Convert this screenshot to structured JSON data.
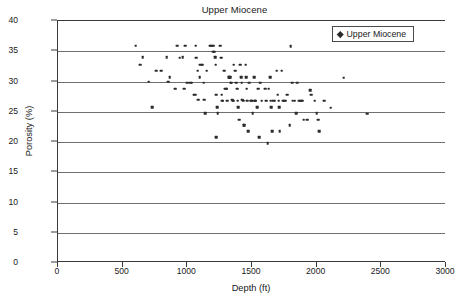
{
  "chart_data": {
    "type": "scatter",
    "title": "Upper Miocene",
    "xlabel": "Depth (ft)",
    "ylabel": "Porosity (%)",
    "xlim": [
      0,
      3000
    ],
    "ylim": [
      0,
      40
    ],
    "xticks": [
      0,
      500,
      1000,
      1500,
      2000,
      2500,
      3000
    ],
    "yticks": [
      0,
      5,
      10,
      15,
      20,
      25,
      30,
      35,
      40
    ],
    "grid": "horizontal",
    "legend_position": "top-right",
    "marker_color": "#2b2b2b",
    "marker_shape": "diamond",
    "series": [
      {
        "name": "Upper Miocene",
        "points": [
          [
            600,
            35.9
          ],
          [
            655,
            34.0
          ],
          [
            635,
            32.8
          ],
          [
            700,
            30.0
          ],
          [
            730,
            25.8
          ],
          [
            760,
            31.8
          ],
          [
            800,
            31.8
          ],
          [
            840,
            34.0
          ],
          [
            850,
            30.0
          ],
          [
            865,
            30.7
          ],
          [
            920,
            35.9
          ],
          [
            905,
            28.8
          ],
          [
            940,
            33.9
          ],
          [
            965,
            34.0
          ],
          [
            975,
            28.8
          ],
          [
            985,
            35.9
          ],
          [
            1000,
            29.8
          ],
          [
            1020,
            29.8
          ],
          [
            1035,
            29.8
          ],
          [
            1050,
            27.8
          ],
          [
            1060,
            27.8
          ],
          [
            1065,
            35.9
          ],
          [
            1070,
            33.9
          ],
          [
            1080,
            31.8
          ],
          [
            1085,
            27.0
          ],
          [
            1095,
            30.7
          ],
          [
            1100,
            32.8
          ],
          [
            1110,
            32.8
          ],
          [
            1120,
            32.8
          ],
          [
            1125,
            29.8
          ],
          [
            1130,
            27.0
          ],
          [
            1140,
            24.8
          ],
          [
            1150,
            31.8
          ],
          [
            1175,
            35.9
          ],
          [
            1185,
            35.9
          ],
          [
            1195,
            35.9
          ],
          [
            1205,
            35.9
          ],
          [
            1200,
            34.9
          ],
          [
            1210,
            34.9
          ],
          [
            1215,
            34.0
          ],
          [
            1220,
            32.8
          ],
          [
            1225,
            27.8
          ],
          [
            1230,
            25.8
          ],
          [
            1235,
            24.8
          ],
          [
            1225,
            20.8
          ],
          [
            1255,
            35.9
          ],
          [
            1260,
            33.9
          ],
          [
            1265,
            27.8
          ],
          [
            1270,
            26.8
          ],
          [
            1275,
            26.8
          ],
          [
            1285,
            31.8
          ],
          [
            1290,
            28.8
          ],
          [
            1300,
            28.8
          ],
          [
            1305,
            28.8
          ],
          [
            1310,
            26.8
          ],
          [
            1320,
            30.7
          ],
          [
            1325,
            30.7
          ],
          [
            1330,
            30.7
          ],
          [
            1335,
            29.8
          ],
          [
            1340,
            29.8
          ],
          [
            1345,
            27.0
          ],
          [
            1350,
            26.8
          ],
          [
            1355,
            26.8
          ],
          [
            1360,
            32.8
          ],
          [
            1370,
            31.8
          ],
          [
            1380,
            29.8
          ],
          [
            1385,
            28.8
          ],
          [
            1390,
            26.8
          ],
          [
            1395,
            25.8
          ],
          [
            1400,
            23.7
          ],
          [
            1410,
            32.8
          ],
          [
            1415,
            30.7
          ],
          [
            1420,
            29.8
          ],
          [
            1425,
            27.0
          ],
          [
            1430,
            26.8
          ],
          [
            1435,
            22.8
          ],
          [
            1440,
            22.8
          ],
          [
            1450,
            32.8
          ],
          [
            1455,
            30.7
          ],
          [
            1460,
            28.8
          ],
          [
            1465,
            26.8
          ],
          [
            1470,
            21.8
          ],
          [
            1480,
            29.8
          ],
          [
            1490,
            26.8
          ],
          [
            1495,
            26.8
          ],
          [
            1500,
            26.8
          ],
          [
            1505,
            24.8
          ],
          [
            1515,
            30.7
          ],
          [
            1520,
            26.8
          ],
          [
            1525,
            26.8
          ],
          [
            1530,
            26.8
          ],
          [
            1540,
            25.8
          ],
          [
            1550,
            28.8
          ],
          [
            1555,
            20.8
          ],
          [
            1565,
            29.8
          ],
          [
            1575,
            26.8
          ],
          [
            1600,
            28.8
          ],
          [
            1610,
            26.8
          ],
          [
            1620,
            19.8
          ],
          [
            1630,
            28.8
          ],
          [
            1640,
            30.7
          ],
          [
            1645,
            26.8
          ],
          [
            1650,
            25.8
          ],
          [
            1655,
            21.8
          ],
          [
            1665,
            26.8
          ],
          [
            1675,
            26.8
          ],
          [
            1690,
            31.8
          ],
          [
            1700,
            27.8
          ],
          [
            1705,
            26.8
          ],
          [
            1710,
            25.8
          ],
          [
            1715,
            21.8
          ],
          [
            1730,
            31.8
          ],
          [
            1740,
            26.8
          ],
          [
            1750,
            26.8
          ],
          [
            1760,
            26.8
          ],
          [
            1770,
            27.8
          ],
          [
            1790,
            22.8
          ],
          [
            1800,
            35.8
          ],
          [
            1810,
            29.8
          ],
          [
            1815,
            26.8
          ],
          [
            1830,
            26.8
          ],
          [
            1840,
            24.8
          ],
          [
            1850,
            29.8
          ],
          [
            1860,
            26.8
          ],
          [
            1870,
            26.8
          ],
          [
            1880,
            26.8
          ],
          [
            1890,
            26.8
          ],
          [
            1900,
            23.7
          ],
          [
            1925,
            23.7
          ],
          [
            1950,
            28.6
          ],
          [
            1960,
            27.8
          ],
          [
            1985,
            26.8
          ],
          [
            2000,
            24.8
          ],
          [
            2010,
            23.7
          ],
          [
            2020,
            21.8
          ],
          [
            2060,
            26.8
          ],
          [
            2110,
            25.7
          ],
          [
            2210,
            30.6
          ],
          [
            2390,
            24.7
          ]
        ]
      }
    ]
  },
  "legend": {
    "label": "Upper Miocene"
  }
}
